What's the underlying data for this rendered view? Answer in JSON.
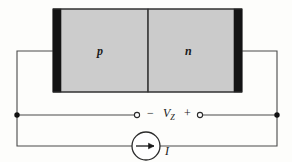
{
  "figure": {
    "type": "circuit-diagram",
    "device": {
      "p_region_label": "p",
      "n_region_label": "n",
      "p_fill_color": "#cccccc",
      "n_fill_color": "#cbcbcb",
      "electrode_color": "#141414",
      "outline_color": "#3a3a3a"
    },
    "circuit": {
      "wire_color": "#4a4a4a",
      "node_color": "#111111",
      "terminal_fill": "#ffffff",
      "voltage_label": "V",
      "voltage_subscript": "Z",
      "negative_sign": "−",
      "positive_sign": "+",
      "current_label": "I",
      "current_source_symbol": "arrow-right-in-circle"
    }
  }
}
